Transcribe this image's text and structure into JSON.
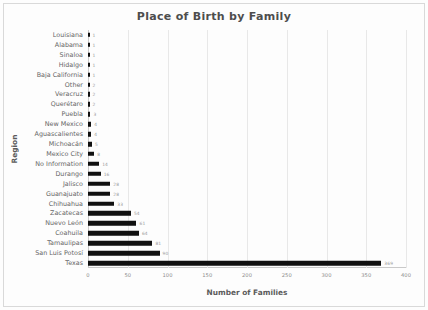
{
  "chart_data": {
    "type": "bar",
    "orientation": "horizontal",
    "title": "Place of Birth by Family",
    "xlabel": "Number of Families",
    "ylabel": "Region",
    "xlim": [
      0,
      400
    ],
    "xticks": [
      "0",
      "50",
      "100",
      "150",
      "200",
      "250",
      "300",
      "350",
      "400"
    ],
    "xtick_values": [
      0,
      50,
      100,
      150,
      200,
      250,
      300,
      350,
      400
    ],
    "grid": "vertical",
    "legend": "none",
    "bar_color": "#111111",
    "categories": [
      "Louisiana",
      "Alabama",
      "Sinaloa",
      "Hidalgo",
      "Baja California",
      "Other",
      "Veracruz",
      "Querétaro",
      "Puebla",
      "New Mexico",
      "Aguascalientes",
      "Michoacán",
      "Mexico City",
      "No Information",
      "Durango",
      "Jalisco",
      "Guanajuato",
      "Chihuahua",
      "Zacatecas",
      "Nuevo León",
      "Coahuila",
      "Tamaulipas",
      "San Luis Potosí",
      "Texas"
    ],
    "values": [
      1,
      1,
      1,
      1,
      1,
      2,
      2,
      2,
      3,
      4,
      4,
      5,
      8,
      14,
      16,
      28,
      28,
      33,
      54,
      61,
      64,
      81,
      90,
      369
    ],
    "value_labels": [
      "1",
      "1",
      "1",
      "1",
      "1",
      "2",
      "2",
      "2",
      "3",
      "4",
      "4",
      "5",
      "8",
      "14",
      "16",
      "28",
      "28",
      "33",
      "54",
      "61",
      "64",
      "81",
      "90",
      "369"
    ]
  }
}
